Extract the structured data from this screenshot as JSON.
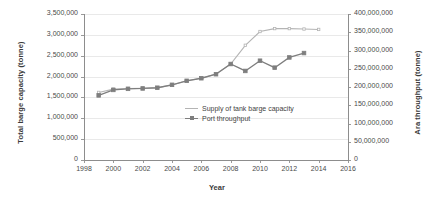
{
  "chart_data": {
    "type": "line",
    "title": "",
    "xlabel": "Year",
    "ylabel": "Total barge capacity (tonne)",
    "y2label": "Ara throughput (tonne)",
    "xlim": [
      1998,
      2016
    ],
    "xticks": [
      "1998",
      "2000",
      "2002",
      "2004",
      "2006",
      "2008",
      "2010",
      "2012",
      "2014",
      "2016"
    ],
    "xtick_values": [
      1998,
      2000,
      2002,
      2004,
      2006,
      2008,
      2010,
      2012,
      2014,
      2016
    ],
    "ylim": [
      0,
      3500000
    ],
    "yticks": [
      "0",
      "500,000",
      "1,000,000",
      "1,500,000",
      "2,000,000",
      "2,500,000",
      "3,000,000",
      "3,500,000"
    ],
    "ytick_values": [
      0,
      500000,
      1000000,
      1500000,
      2000000,
      2500000,
      3000000,
      3500000
    ],
    "y2lim": [
      0,
      400000000
    ],
    "y2ticks": [
      "0",
      "50,000,000",
      "100,000,000",
      "150,000,000",
      "200,000,000",
      "250,000,000",
      "300,000,000",
      "350,000,000",
      "400,000,000"
    ],
    "y2tick_values": [
      0,
      50000000,
      100000000,
      150000000,
      200000000,
      250000000,
      300000000,
      350000000,
      400000000
    ],
    "grid": true,
    "legend_position": "inside-center-right",
    "series": [
      {
        "name": "Supply of tank barge capacity",
        "axis": "left",
        "color": "#b4b4b4",
        "marker": "none",
        "x": [
          1999,
          2000,
          2001,
          2002,
          2003,
          2004,
          2005,
          2006,
          2007,
          2008,
          2009,
          2010,
          2011,
          2012,
          2013,
          2014
        ],
        "values": [
          1620000,
          1700000,
          1715000,
          1720000,
          1730000,
          1800000,
          1900000,
          1960000,
          2060000,
          2300000,
          2750000,
          3080000,
          3150000,
          3150000,
          3140000,
          3130000
        ]
      },
      {
        "name": "Port throughput",
        "axis": "right",
        "color": "#7e7e7e",
        "marker": "square",
        "x": [
          1999,
          2000,
          2001,
          2002,
          2003,
          2004,
          2005,
          2006,
          2007,
          2008,
          2009,
          2010,
          2011,
          2012,
          2013
        ],
        "values": [
          177000000,
          192000000,
          195000000,
          196000000,
          198000000,
          206000000,
          217000000,
          224000000,
          235000000,
          263000000,
          244000000,
          272000000,
          253000000,
          281000000,
          293000000
        ]
      }
    ]
  },
  "legend": {
    "items": [
      {
        "label": "Supply of tank barge capacity"
      },
      {
        "label": "Port throughput"
      }
    ]
  }
}
